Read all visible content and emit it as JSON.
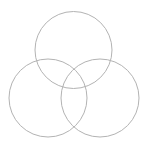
{
  "diagram": {
    "type": "venn",
    "stroke_color": "#b3b3b3",
    "stroke_width": 1,
    "fill": "none",
    "circles": [
      {
        "id": "top",
        "cx": 73.5,
        "cy": 50,
        "r": 38.5
      },
      {
        "id": "bottom-left",
        "cx": 48,
        "cy": 98,
        "r": 39
      },
      {
        "id": "bottom-right",
        "cx": 100,
        "cy": 98,
        "r": 39
      }
    ]
  }
}
